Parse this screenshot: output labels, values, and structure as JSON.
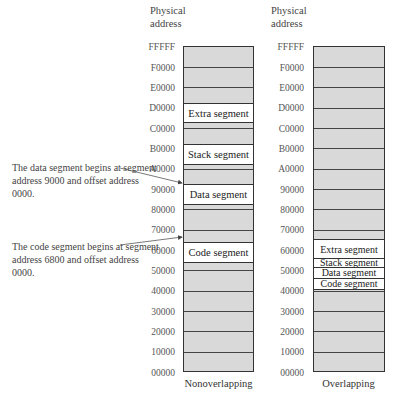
{
  "header_label": "Physical address",
  "address_ticks": [
    "FFFFF",
    "F0000",
    "E0000",
    "D0000",
    "C0000",
    "B0000",
    "A0000",
    "90000",
    "80000",
    "70000",
    "60000",
    "50000",
    "40000",
    "30000",
    "20000",
    "10000",
    "00000"
  ],
  "nonoverlapping": {
    "caption": "Nonoverlapping",
    "segments": [
      {
        "name": "Extra segment",
        "start": "D0000"
      },
      {
        "name": "Stack segment",
        "start": "B0000"
      },
      {
        "name": "Data segment",
        "start": "90000"
      },
      {
        "name": "Code segment",
        "start": "68000"
      }
    ]
  },
  "overlapping": {
    "caption": "Overlapping",
    "segments": [
      {
        "name": "Extra segment"
      },
      {
        "name": "Stack segment"
      },
      {
        "name": "Data segment"
      },
      {
        "name": "Code segment"
      }
    ]
  },
  "annotations": [
    {
      "text": "The data segment begins at segment address 9000 and offset address 0000."
    },
    {
      "text": "The code segment begins at segment address 6800 and offset address 0000."
    }
  ],
  "colors": {
    "fill": "#d9d9d9",
    "segment": "#ffffff",
    "border": "#333333"
  }
}
